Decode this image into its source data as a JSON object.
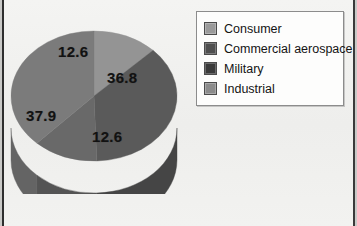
{
  "chart_data": {
    "type": "pie",
    "title": "",
    "style": "3d-pie",
    "categories": [
      "Consumer",
      "Commercial aerospace",
      "Military",
      "Industrial"
    ],
    "values": [
      12.6,
      36.8,
      12.6,
      37.9
    ],
    "data_labels": [
      "12.6",
      "36.8",
      "12.6",
      "37.9"
    ],
    "units": "percent",
    "legend_position": "right",
    "grid": false,
    "slice_colors": [
      "#949494",
      "#5a5a5a",
      "#696969",
      "#7b7b7b"
    ],
    "slice_side_colors": [
      "#7c7c7c",
      "#454545",
      "#545454",
      "#646464"
    ],
    "slices": [
      {
        "label": "Consumer",
        "value": 12.6,
        "color": "#949494",
        "side_color": "#7c7c7c"
      },
      {
        "label": "Commercial aerospace",
        "value": 36.8,
        "color": "#5a5a5a",
        "side_color": "#454545"
      },
      {
        "label": "Military",
        "value": 12.6,
        "color": "#696969",
        "side_color": "#545454"
      },
      {
        "label": "Industrial",
        "value": 37.9,
        "color": "#7b7b7b",
        "side_color": "#646464"
      }
    ]
  },
  "legend": {
    "items": [
      {
        "label": "Consumer",
        "swatch": "#9a9a9a"
      },
      {
        "label": "Commercial aerospace",
        "swatch": "#4f4f4f"
      },
      {
        "label": "Military",
        "swatch": "#3a3a3a"
      },
      {
        "label": "Industrial",
        "swatch": "#8b8b8b"
      }
    ]
  },
  "labels": {
    "consumer": "12.6",
    "aerospace": "36.8",
    "military": "12.6",
    "industrial": "37.9"
  },
  "page": {
    "background": "#f1f1ef",
    "edge_color": "#2e2e2e"
  }
}
